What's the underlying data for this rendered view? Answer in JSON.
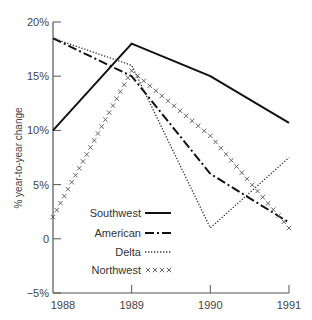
{
  "chart_data": {
    "type": "line",
    "title": "",
    "xlabel": "",
    "ylabel": "% year-to-year change",
    "x": [
      "1988",
      "1989",
      "1990",
      "1991"
    ],
    "ylim": [
      -5,
      20
    ],
    "yticks": [
      "20%",
      "15%",
      "10%",
      "5%",
      "0",
      "−5%"
    ],
    "ytick_values": [
      20,
      15,
      10,
      5,
      0,
      -5
    ],
    "grid": false,
    "legend_position": "lower-left inside",
    "series": [
      {
        "name": "Southwest",
        "style": "solid",
        "values": [
          10,
          18,
          15,
          10.7
        ]
      },
      {
        "name": "American",
        "style": "dash-dot",
        "values": [
          18.5,
          15,
          6,
          1.5
        ]
      },
      {
        "name": "Delta",
        "style": "dotted",
        "values": [
          18.5,
          16,
          1,
          7.5
        ]
      },
      {
        "name": "Northwest",
        "style": "crosses",
        "values": [
          2,
          15.5,
          9.5,
          1
        ]
      }
    ]
  }
}
